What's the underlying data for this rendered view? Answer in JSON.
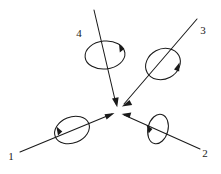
{
  "figure": {
    "title": "",
    "background_color": "#ffffff",
    "stroke_color": "#1a1a1a",
    "width": 221,
    "height": 174,
    "center_point": {
      "x": 118,
      "y": 111
    }
  },
  "labels": {
    "one": "1",
    "two": "2",
    "three": "3",
    "four": "4"
  },
  "vectors": [
    {
      "id": "vector-1",
      "label": "1",
      "label_position": {
        "x": 12,
        "y": 158
      },
      "tail": {
        "x": 20,
        "y": 152
      },
      "head": {
        "x": 112,
        "y": 114
      },
      "direction": "lower-left to center",
      "spin": {
        "center": {
          "x": 72,
          "y": 130
        },
        "rx": 18,
        "ry": 13,
        "rotation_deg": -22,
        "arrow_side": "left",
        "sense": "clockwise"
      }
    },
    {
      "id": "vector-2",
      "label": "2",
      "label_position": {
        "x": 203,
        "y": 155
      },
      "tail": {
        "x": 200,
        "y": 149
      },
      "head": {
        "x": 124,
        "y": 115
      },
      "direction": "lower-right to center",
      "spin": {
        "center": {
          "x": 158,
          "y": 129
        },
        "rx": 10,
        "ry": 15,
        "rotation_deg": 14,
        "arrow_side": "left",
        "sense": "clockwise"
      }
    },
    {
      "id": "vector-3",
      "label": "3",
      "label_position": {
        "x": 201,
        "y": 33
      },
      "tail": {
        "x": 197,
        "y": 19
      },
      "head": {
        "x": 124,
        "y": 104
      },
      "direction": "upper-right to center",
      "spin": {
        "center": {
          "x": 163,
          "y": 64
        },
        "rx": 18,
        "ry": 15,
        "rotation_deg": -28,
        "arrow_side": "right",
        "sense": "clockwise"
      }
    },
    {
      "id": "vector-4",
      "label": "4",
      "label_position": {
        "x": 78,
        "y": 35
      },
      "tail": {
        "x": 94,
        "y": 10
      },
      "head": {
        "x": 116,
        "y": 104
      },
      "direction": "top to center",
      "spin": {
        "center": {
          "x": 105,
          "y": 55
        },
        "rx": 20,
        "ry": 14,
        "rotation_deg": -6,
        "arrow_side": "top-right",
        "sense": "clockwise"
      }
    }
  ]
}
